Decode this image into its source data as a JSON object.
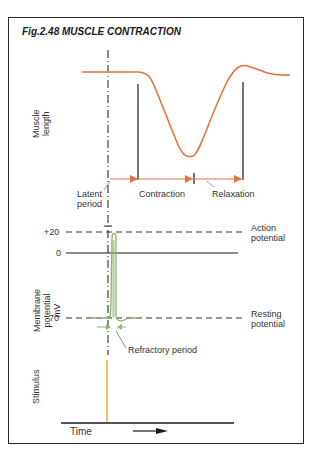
{
  "figure": {
    "title": "Fig.2.48  MUSCLE CONTRACTION"
  },
  "panels": {
    "muscle_length": {
      "y_label_line1": "Muscle",
      "y_label_line2": "length",
      "phases": {
        "latent_line1": "Latent",
        "latent_line2": "period",
        "contraction": "Contraction",
        "relaxation": "Relaxation"
      }
    },
    "membrane_potential": {
      "y_label_line1": "Membrane",
      "y_label_line2": "potential",
      "y_label_line3": "mV",
      "ticks": [
        "+20",
        "0",
        "-70"
      ],
      "action_line1": "Action",
      "action_line2": "potential",
      "resting_line1": "Resting",
      "resting_line2": "potential",
      "refractory": "Refractory period"
    },
    "stimulus": {
      "y_label": "Stimulus",
      "x_label": "Time"
    }
  },
  "colors": {
    "muscle_curve": "#e8743b",
    "action_potential": "#8db36a",
    "stimulus": "#e8b830",
    "lines": "#1a1a1a"
  }
}
